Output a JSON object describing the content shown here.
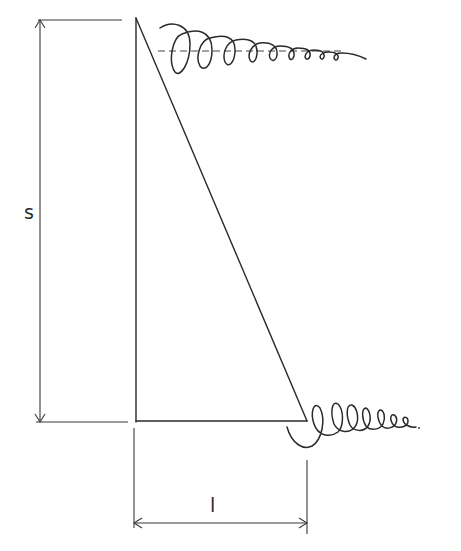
{
  "diagram": {
    "type": "triangle-dimension-sketch",
    "labels": {
      "height": "s",
      "base": "l"
    },
    "colors": {
      "ink": "#2a2a2a",
      "background": "#ffffff"
    },
    "elements": [
      "right-triangle",
      "vertical-dimension-s",
      "horizontal-dimension-l",
      "top-spiral-curl-with-dashed-axis",
      "bottom-spiral-curl"
    ]
  }
}
